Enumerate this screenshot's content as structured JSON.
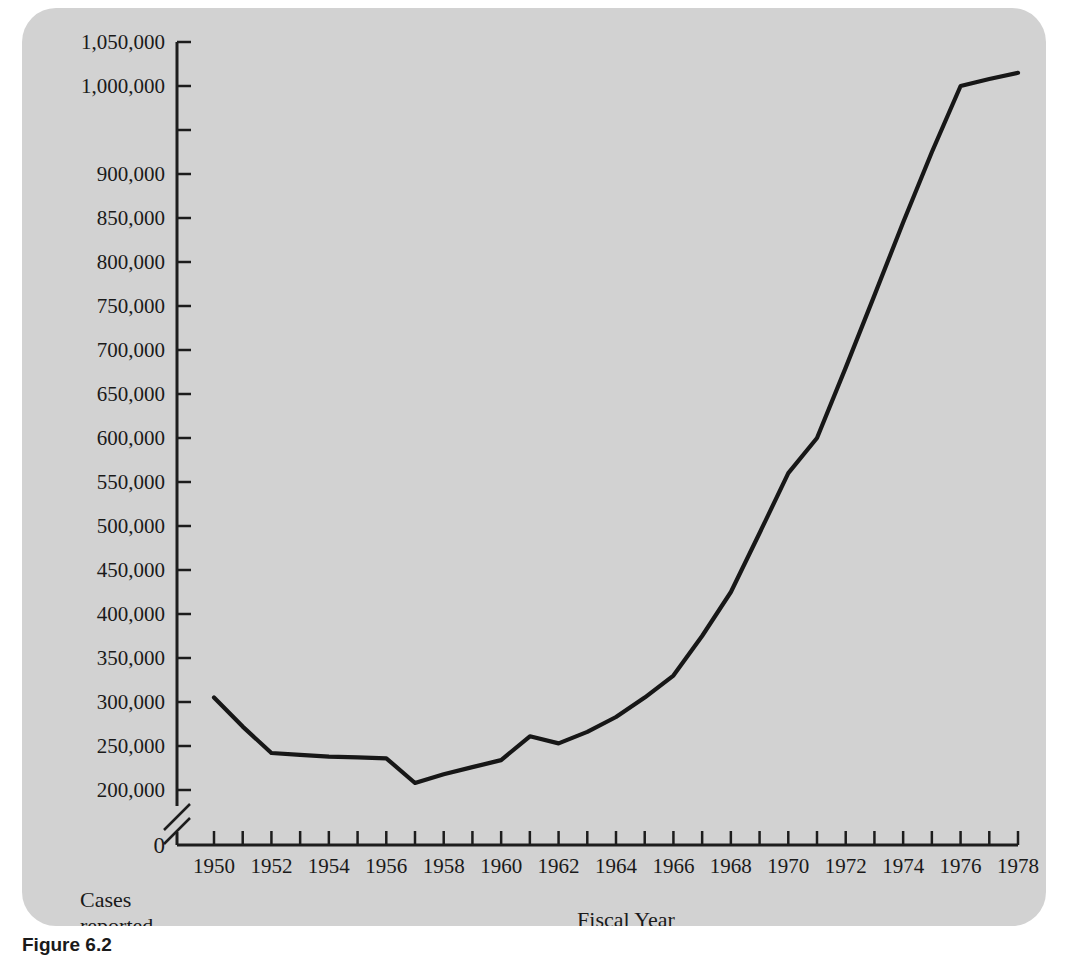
{
  "figure": {
    "caption": "Figure 6.2",
    "background_color": "#d2d2d2",
    "line_color": "#171717",
    "axis_color": "#1d1d1d"
  },
  "axis_titles": {
    "y_line1": "Cases",
    "y_line2": "reported",
    "x": "Fiscal Year"
  },
  "y_axis": {
    "tick_values": [
      200000,
      250000,
      300000,
      350000,
      400000,
      450000,
      500000,
      550000,
      600000,
      650000,
      700000,
      750000,
      800000,
      850000,
      900000,
      950000,
      1000000,
      1050000
    ],
    "tick_labels": [
      "200,000",
      "250,000",
      "300,000",
      "350,000",
      "400,000",
      "450,000",
      "500,000",
      "550,000",
      "600,000",
      "650,000",
      "700,000",
      "750,000",
      "800,000",
      "850,000",
      "900,000",
      "",
      "1,000,000",
      "1,050,000"
    ],
    "zero_label": "0",
    "has_axis_break": true
  },
  "x_axis": {
    "tick_values": [
      1950,
      1951,
      1952,
      1953,
      1954,
      1955,
      1956,
      1957,
      1958,
      1959,
      1960,
      1961,
      1962,
      1963,
      1964,
      1965,
      1966,
      1967,
      1968,
      1969,
      1970,
      1971,
      1972,
      1973,
      1974,
      1975,
      1976,
      1977,
      1978
    ],
    "tick_labels": [
      "1950",
      "",
      "1952",
      "",
      "1954",
      "",
      "1956",
      "",
      "1958",
      "",
      "1960",
      "",
      "1962",
      "",
      "1964",
      "",
      "1966",
      "",
      "1968",
      "",
      "1970",
      "",
      "1972",
      "",
      "1974",
      "",
      "1976",
      "",
      "1978"
    ]
  },
  "chart_data": {
    "type": "line",
    "title": "",
    "xlabel": "Fiscal Year",
    "ylabel": "Cases reported",
    "xlim": [
      1950,
      1978
    ],
    "ylim": [
      200000,
      1050000
    ],
    "grid": false,
    "legend": null,
    "axis_break": "y-axis broken between 0 and 200,000",
    "x": [
      1950,
      1951,
      1952,
      1953,
      1954,
      1955,
      1956,
      1957,
      1958,
      1959,
      1960,
      1961,
      1962,
      1963,
      1964,
      1965,
      1966,
      1967,
      1968,
      1969,
      1970,
      1971,
      1972,
      1973,
      1974,
      1975,
      1976,
      1977,
      1978
    ],
    "values": [
      305000,
      272000,
      242000,
      240000,
      238000,
      237000,
      236000,
      208000,
      218000,
      226000,
      234000,
      261000,
      253000,
      266000,
      283000,
      305000,
      330000,
      375000,
      425000,
      492000,
      560000,
      600000,
      680000,
      762000,
      845000,
      925000,
      1000000,
      1008000,
      1015000
    ]
  }
}
